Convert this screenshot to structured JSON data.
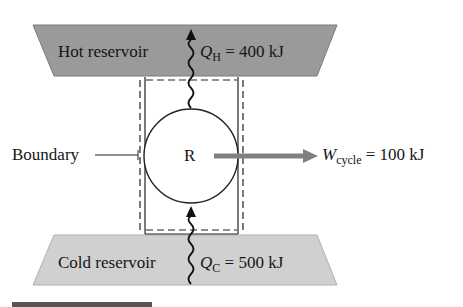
{
  "diagram": {
    "hot_reservoir": {
      "label": "Hot reservoir",
      "heat_symbol": "Q",
      "heat_subscript": "H",
      "heat_value": "= 400 kJ",
      "fill": "#9a9a9a"
    },
    "cold_reservoir": {
      "label": "Cold reservoir",
      "heat_symbol": "Q",
      "heat_subscript": "C",
      "heat_value": "= 500 kJ",
      "fill": "#d0d0d0"
    },
    "device": {
      "label": "R"
    },
    "boundary": {
      "label": "Boundary"
    },
    "work": {
      "symbol": "W",
      "subscript": "cycle",
      "value": "= 100 kJ",
      "arrow_color": "#808080"
    }
  }
}
